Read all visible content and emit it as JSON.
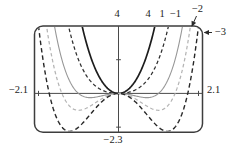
{
  "page": {
    "background": "#ffffff"
  },
  "frame": {
    "stroke": "#3d3d3d",
    "axis_color": "#4a4a4a",
    "arrow_color": "#2a2a2a"
  },
  "chart_data": {
    "type": "line",
    "formula": "y = x^4 + c*x^2",
    "window": {
      "xmin": -2.1,
      "xmax": 2.1,
      "ymin": -2.3,
      "ymax": 4
    },
    "axis_labels": {
      "top": "4",
      "left": "−2.1",
      "right": "2.1",
      "bottom": "−2.3"
    },
    "x_ticks": [
      -2,
      2
    ],
    "y_ticks": [
      -2,
      2
    ],
    "grid": false,
    "legend_position": "labels along top edge",
    "series": [
      {
        "label": "4",
        "c": 4,
        "style": "solid",
        "color": "#1c1c1c",
        "width": 1.7,
        "dash": "",
        "min_point": [
          0,
          0
        ],
        "top_exit_x": 0.91
      },
      {
        "label": "1",
        "c": 1,
        "style": "dashed",
        "color": "#2e2e2e",
        "width": 1.25,
        "dash": "3.5,2.6",
        "min_point": [
          0,
          0
        ],
        "top_exit_x": 1.25
      },
      {
        "label": "−1",
        "c": -1,
        "style": "solid",
        "color": "#979797",
        "width": 1.1,
        "dash": "",
        "min_point": [
          0.71,
          -0.25
        ],
        "top_exit_x": 1.6
      },
      {
        "label": "−2",
        "c": -2,
        "style": "dashed",
        "color": "#b5b5b5",
        "width": 1.25,
        "dash": "3.5,2.6",
        "min_point": [
          1.0,
          -1.0
        ],
        "top_exit_x": 1.8
      },
      {
        "label": "−3",
        "c": -3,
        "style": "dashed",
        "color": "#282828",
        "width": 1.4,
        "dash": "4.5,3",
        "min_point": [
          1.22,
          -2.25
        ],
        "top_exit_x": 2.0
      }
    ],
    "annotations": [
      {
        "target": "−2",
        "type": "arrow",
        "note": "arrow from label down-left to curve near top-right corner"
      },
      {
        "target": "−3",
        "type": "arrow",
        "note": "arrow from label left to curve at right edge"
      }
    ]
  }
}
